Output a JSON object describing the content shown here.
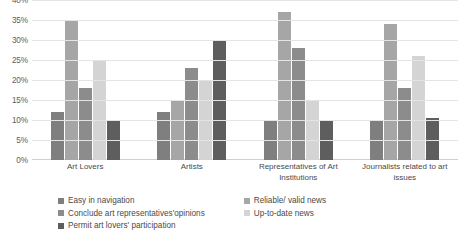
{
  "chart_data": {
    "type": "bar",
    "title": "",
    "xlabel": "",
    "ylabel": "",
    "ylim": [
      0,
      40
    ],
    "grid": true,
    "legend_position": "bottom",
    "y_ticks": [
      "0%",
      "5%",
      "10%",
      "15%",
      "20%",
      "25%",
      "30%",
      "35%",
      "40%"
    ],
    "y_tick_values": [
      0,
      5,
      10,
      15,
      20,
      25,
      30,
      35,
      40
    ],
    "categories": [
      "Art Lovers",
      "Artists",
      "Representatives of Art Institutions",
      "Journalists related to art issues"
    ],
    "category_lines": [
      [
        "Art Lovers"
      ],
      [
        "Artists"
      ],
      [
        "Representatives of Art",
        "Institutions"
      ],
      [
        "Journalists related to art",
        "issues"
      ]
    ],
    "series": [
      {
        "name": "Easy in navigation",
        "color": "#7f7f7f",
        "values": [
          12,
          12,
          10,
          10
        ]
      },
      {
        "name": "Reliable/ valid news",
        "color": "#a6a6a6",
        "values": [
          35,
          15,
          37,
          34
        ]
      },
      {
        "name": "Conclude art representatives'opinions",
        "color": "#8c8c8c",
        "values": [
          18,
          23,
          28,
          18
        ]
      },
      {
        "name": "Up-to-date news",
        "color": "#d4d4d4",
        "values": [
          25,
          20,
          15,
          26
        ]
      },
      {
        "name": "Permit art lovers' participation",
        "color": "#5e5e5e",
        "values": [
          10,
          30,
          10,
          10.5
        ]
      }
    ],
    "legend_columns": [
      [
        "Easy in navigation",
        "Conclude art representatives'opinions",
        "Permit art lovers' participation"
      ],
      [
        "Reliable/ valid news",
        "Up-to-date news"
      ]
    ]
  }
}
